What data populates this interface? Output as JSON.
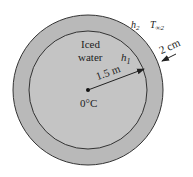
{
  "diagram": {
    "type": "spherical tank cross-section",
    "colors": {
      "shell_fill": "#b9b9b9",
      "interior_fill": "#c4c4c4",
      "outline": "#333333",
      "background": "#ffffff"
    },
    "labels": {
      "interior_line1": "Iced",
      "interior_line2": "water",
      "inner_coeff": "h",
      "inner_coeff_sub": "1",
      "outer_coeff": "h",
      "outer_coeff_sub": "2",
      "ambient_temp": "T",
      "ambient_temp_sub": "∞2",
      "radius": "1.5 m",
      "thickness": "2 cm",
      "center_temp": "0°C"
    }
  }
}
